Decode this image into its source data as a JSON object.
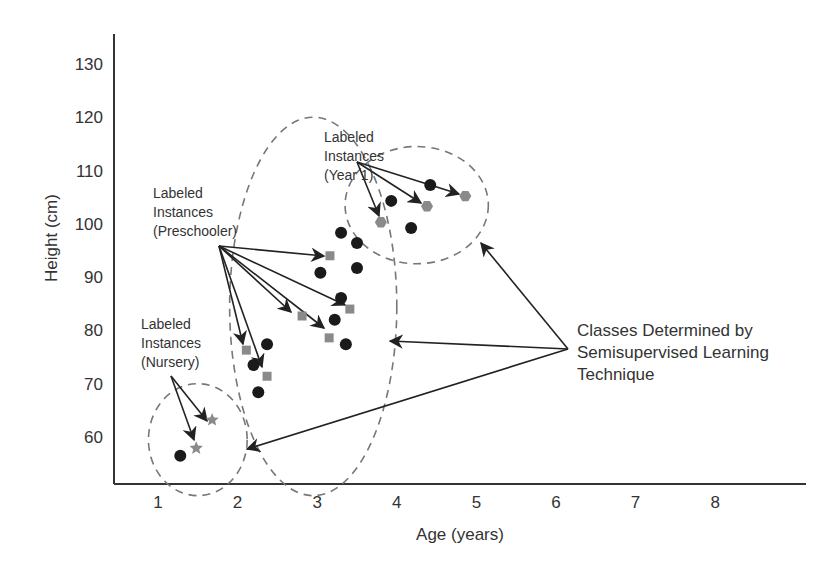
{
  "chart_data": {
    "type": "scatter",
    "title": "",
    "xlabel": "Age (years)",
    "ylabel": "Height (cm)",
    "xlim": [
      0.45,
      9.1
    ],
    "ylim": [
      50.5,
      133
    ],
    "x_ticks": [
      1,
      2,
      3,
      4,
      5,
      6,
      7,
      8
    ],
    "y_ticks": [
      60,
      70,
      80,
      90,
      100,
      110,
      120,
      130
    ],
    "grid": false,
    "series": [
      {
        "name": "Unlabeled instances",
        "marker": "circle",
        "color": "#1a1a1a",
        "points": [
          [
            1.28,
            56.5
          ],
          [
            3.3,
            98.3
          ],
          [
            3.5,
            96.4
          ],
          [
            3.04,
            90.8
          ],
          [
            3.5,
            91.7
          ],
          [
            3.3,
            86.1
          ],
          [
            3.22,
            82.0
          ],
          [
            3.36,
            77.4
          ],
          [
            2.37,
            77.4
          ],
          [
            2.2,
            73.5
          ],
          [
            2.26,
            68.4
          ],
          [
            3.93,
            104.3
          ],
          [
            4.42,
            107.3
          ],
          [
            4.18,
            99.2
          ]
        ]
      },
      {
        "name": "Labeled Instances (Nursery)",
        "marker": "star",
        "color": "#8a8a8a",
        "points": [
          [
            1.48,
            57.9
          ],
          [
            1.68,
            63.2
          ]
        ]
      },
      {
        "name": "Labeled Instances (Preschooler)",
        "marker": "square",
        "color": "#8a8a8a",
        "points": [
          [
            3.16,
            94.0
          ],
          [
            2.81,
            82.7
          ],
          [
            3.41,
            84.0
          ],
          [
            3.15,
            78.6
          ],
          [
            2.11,
            76.3
          ],
          [
            2.37,
            71.4
          ]
        ]
      },
      {
        "name": "Labeled Instances (Year 1)",
        "marker": "hexagon",
        "color": "#8a8a8a",
        "points": [
          [
            3.8,
            100.3
          ],
          [
            4.38,
            103.3
          ],
          [
            4.86,
            105.2
          ]
        ]
      }
    ],
    "clusters": [
      {
        "name": "Nursery",
        "cx": 1.5,
        "cy": 59.5,
        "rx_years": 0.62,
        "ry_cm": 10.5
      },
      {
        "name": "Preschooler",
        "cx": 2.95,
        "cy": 84.5,
        "rx_years": 1.05,
        "ry_cm": 35.5
      },
      {
        "name": "Year 1",
        "cx": 4.25,
        "cy": 103.5,
        "rx_years": 0.9,
        "ry_cm": 11.0
      }
    ],
    "annotations": [
      {
        "text": [
          "Labeled",
          "Instances",
          "(Year 1)"
        ]
      },
      {
        "text": [
          "Labeled",
          "Instances",
          "(Preschooler)"
        ]
      },
      {
        "text": [
          "Labeled",
          "Instances",
          "(Nursery)"
        ]
      },
      {
        "text": [
          "Classes Determined by",
          "Semisupervised Learning",
          "Technique"
        ]
      }
    ]
  },
  "labels": {
    "x_axis": "Age (years)",
    "y_axis": "Height (cm)",
    "year1": [
      "Labeled",
      "Instances",
      "(Year 1)"
    ],
    "preschool": [
      "Labeled",
      "Instances",
      "(Preschooler)"
    ],
    "nursery": [
      "Labeled",
      "Instances",
      "(Nursery)"
    ],
    "classes": [
      "Classes Determined by",
      "Semisupervised Learning",
      "Technique"
    ]
  }
}
